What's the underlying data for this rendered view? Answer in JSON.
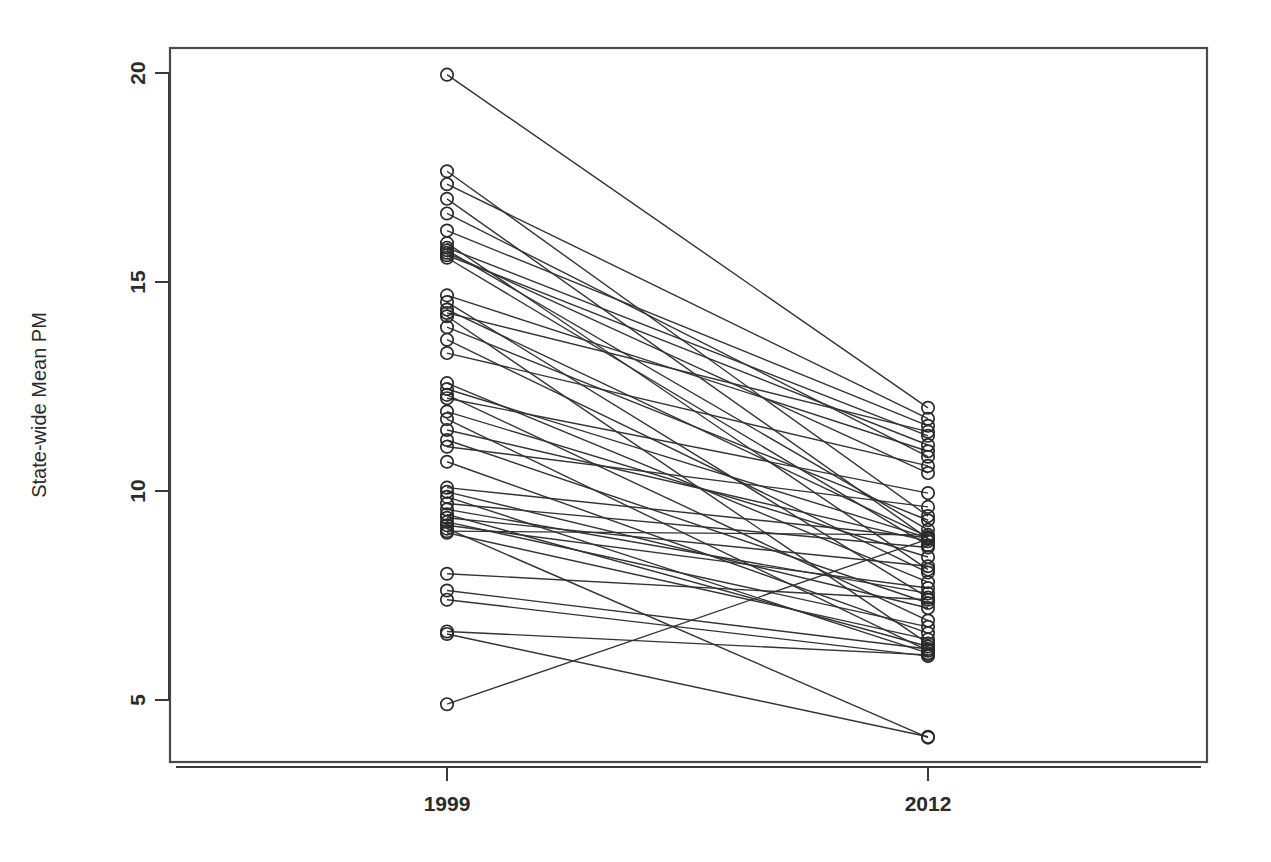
{
  "chart_data": {
    "type": "line",
    "title": "",
    "subtitle": "",
    "xlabel": "",
    "ylabel": "State-wide Mean PM",
    "categories": [
      "1999",
      "2012"
    ],
    "x": [
      1999,
      2012
    ],
    "xlim": [
      1996.6,
      2014.6
    ],
    "ylim": [
      3.6,
      21.2
    ],
    "ytick_values": [
      5,
      10,
      15,
      20
    ],
    "ytick_labels": [
      "5",
      "10",
      "15",
      "20"
    ],
    "xtick_labels": [
      "1999",
      "2012"
    ],
    "grid": false,
    "legend": false,
    "legend_position": "none",
    "marker": "open-circle",
    "series_color": "#333333",
    "series": [
      {
        "name": "s01",
        "values": [
          19.96,
          11.99
        ]
      },
      {
        "name": "s02",
        "values": [
          17.65,
          9.4
        ]
      },
      {
        "name": "s03",
        "values": [
          17.34,
          11.73
        ]
      },
      {
        "name": "s04",
        "values": [
          16.99,
          8.86
        ]
      },
      {
        "name": "s05",
        "values": [
          16.64,
          10.82
        ]
      },
      {
        "name": "s06",
        "values": [
          16.23,
          11.56
        ]
      },
      {
        "name": "s07",
        "values": [
          15.93,
          8.12
        ]
      },
      {
        "name": "s08",
        "values": [
          15.82,
          11.32
        ]
      },
      {
        "name": "s09",
        "values": [
          15.76,
          9.07
        ]
      },
      {
        "name": "s10",
        "values": [
          15.7,
          10.43
        ]
      },
      {
        "name": "s11",
        "values": [
          15.64,
          11.1
        ]
      },
      {
        "name": "s12",
        "values": [
          15.58,
          8.7
        ]
      },
      {
        "name": "s13",
        "values": [
          14.68,
          10.95
        ]
      },
      {
        "name": "s14",
        "values": [
          14.52,
          7.45
        ]
      },
      {
        "name": "s15",
        "values": [
          14.34,
          8.9
        ]
      },
      {
        "name": "s16",
        "values": [
          14.26,
          11.42
        ]
      },
      {
        "name": "s17",
        "values": [
          14.18,
          6.35
        ]
      },
      {
        "name": "s18",
        "values": [
          13.92,
          9.3
        ]
      },
      {
        "name": "s19",
        "values": [
          13.62,
          8.05
        ]
      },
      {
        "name": "s20",
        "values": [
          13.3,
          10.6
        ]
      },
      {
        "name": "s21",
        "values": [
          12.58,
          7.82
        ]
      },
      {
        "name": "s22",
        "values": [
          12.44,
          8.88
        ]
      },
      {
        "name": "s23",
        "values": [
          12.3,
          6.9
        ]
      },
      {
        "name": "s24",
        "values": [
          12.22,
          9.95
        ]
      },
      {
        "name": "s25",
        "values": [
          11.9,
          8.42
        ]
      },
      {
        "name": "s26",
        "values": [
          11.72,
          6.18
        ]
      },
      {
        "name": "s27",
        "values": [
          11.46,
          8.8
        ]
      },
      {
        "name": "s28",
        "values": [
          11.22,
          7.32
        ]
      },
      {
        "name": "s29",
        "values": [
          11.06,
          9.62
        ]
      },
      {
        "name": "s30",
        "values": [
          10.7,
          6.6
        ]
      },
      {
        "name": "s31",
        "values": [
          10.08,
          8.88
        ]
      },
      {
        "name": "s32",
        "values": [
          9.98,
          7.2
        ]
      },
      {
        "name": "s33",
        "values": [
          9.86,
          6.12
        ]
      },
      {
        "name": "s34",
        "values": [
          9.7,
          8.65
        ]
      },
      {
        "name": "s35",
        "values": [
          9.56,
          7.55
        ]
      },
      {
        "name": "s36",
        "values": [
          9.44,
          6.28
        ]
      },
      {
        "name": "s37",
        "values": [
          9.36,
          8.2
        ]
      },
      {
        "name": "s38",
        "values": [
          9.26,
          6.75
        ]
      },
      {
        "name": "s39",
        "values": [
          9.18,
          7.68
        ]
      },
      {
        "name": "s40",
        "values": [
          9.1,
          4.1
        ]
      },
      {
        "name": "s41",
        "values": [
          9.04,
          8.95
        ]
      },
      {
        "name": "s42",
        "values": [
          9.0,
          6.45
        ]
      },
      {
        "name": "s43",
        "values": [
          8.02,
          7.4
        ]
      },
      {
        "name": "s44",
        "values": [
          7.62,
          6.22
        ]
      },
      {
        "name": "s45",
        "values": [
          7.4,
          6.05
        ]
      },
      {
        "name": "s46",
        "values": [
          6.64,
          6.08
        ]
      },
      {
        "name": "s47",
        "values": [
          6.58,
          4.12
        ]
      },
      {
        "name": "s48",
        "values": [
          4.9,
          8.85
        ]
      }
    ]
  }
}
